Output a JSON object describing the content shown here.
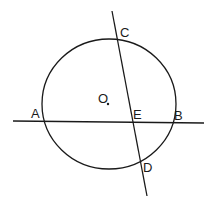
{
  "diagram": {
    "type": "geometry-circle-chords",
    "stroke_color": "#1a1a1a",
    "background": "#ffffff",
    "circle": {
      "center_label": "O",
      "cx": 109,
      "cy": 104,
      "rx": 67,
      "ry": 65
    },
    "lines": [
      {
        "name": "chord-AB-line",
        "x1": 13,
        "y1": 121,
        "x2": 204,
        "y2": 123
      },
      {
        "name": "chord-CD-line",
        "x1": 112,
        "y1": 11,
        "x2": 147,
        "y2": 196
      }
    ],
    "points": [
      {
        "label": "A",
        "x": 31,
        "y": 118
      },
      {
        "label": "B",
        "x": 174,
        "y": 120
      },
      {
        "label": "C",
        "x": 120,
        "y": 37
      },
      {
        "label": "D",
        "x": 143,
        "y": 172
      },
      {
        "label": "E",
        "x": 133,
        "y": 119
      },
      {
        "label": "O",
        "x": 98,
        "y": 103
      }
    ],
    "center_dot": {
      "x": 108,
      "y": 104
    }
  }
}
